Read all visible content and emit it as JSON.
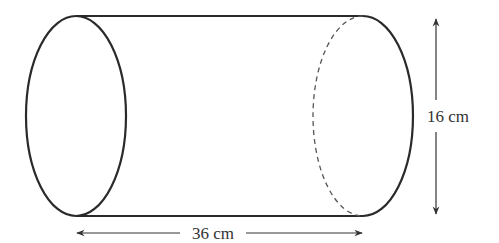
{
  "diagram": {
    "shape": "cylinder",
    "length_label": "36 cm",
    "height_label": "16 cm",
    "colors": {
      "stroke": "#2a2a2a",
      "arrow": "#333333",
      "text": "#333333"
    }
  }
}
